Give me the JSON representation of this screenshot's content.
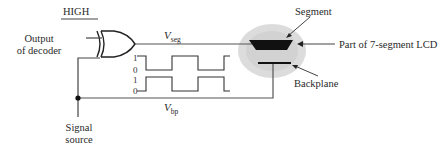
{
  "diagram": {
    "type": "LCD segment drive circuit",
    "inputs": {
      "high_label": "HIGH",
      "decoder_label_line1": "Output",
      "decoder_label_line2": "of decoder",
      "signal_label_line1": "Signal",
      "signal_label_line2": "source"
    },
    "gate": {
      "type": "XOR"
    },
    "signals": {
      "vseg_main": "V",
      "vseg_sub": "seg",
      "vbp_main": "V",
      "vbp_sub": "bp"
    },
    "waveforms": {
      "top_labels": [
        "1",
        "0"
      ],
      "bottom_labels": [
        "1",
        "0"
      ],
      "top_sequence": [
        1,
        0,
        1,
        0,
        1
      ],
      "bottom_sequence": [
        0,
        1,
        0,
        1,
        0
      ]
    },
    "lcd": {
      "segment_label": "Segment",
      "part_label": "Part of 7-segment LCD",
      "backplane_label": "Backplane"
    },
    "colors": {
      "line": "#555555",
      "segment_fill": "#111111",
      "halo": "#d9d9d9"
    }
  }
}
